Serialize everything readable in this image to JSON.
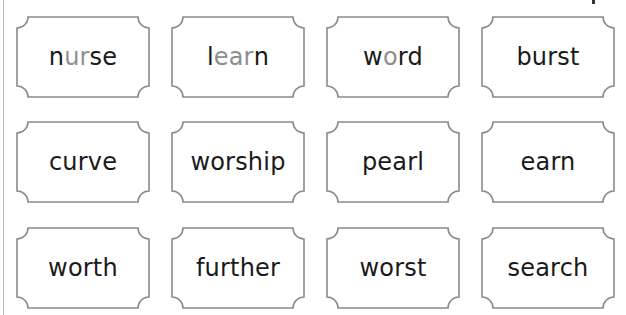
{
  "worksheet": {
    "border_color": "#8a8a8a",
    "text_color": "#1a1a1a",
    "highlight_color": "#8e8e8e",
    "cards": [
      {
        "word": "nurse",
        "parts": [
          {
            "t": "n",
            "hl": false
          },
          {
            "t": "ur",
            "hl": true
          },
          {
            "t": "se",
            "hl": false
          }
        ]
      },
      {
        "word": "learn",
        "parts": [
          {
            "t": "l",
            "hl": false
          },
          {
            "t": "ear",
            "hl": true
          },
          {
            "t": "n",
            "hl": false
          }
        ]
      },
      {
        "word": "word",
        "parts": [
          {
            "t": "w",
            "hl": false
          },
          {
            "t": "o",
            "hl": true
          },
          {
            "t": "rd",
            "hl": false
          }
        ]
      },
      {
        "word": "burst",
        "parts": [
          {
            "t": "burst",
            "hl": false
          }
        ]
      },
      {
        "word": "curve",
        "parts": [
          {
            "t": "curve",
            "hl": false
          }
        ]
      },
      {
        "word": "worship",
        "parts": [
          {
            "t": "worship",
            "hl": false
          }
        ]
      },
      {
        "word": "pearl",
        "parts": [
          {
            "t": "pearl",
            "hl": false
          }
        ]
      },
      {
        "word": "earn",
        "parts": [
          {
            "t": "earn",
            "hl": false
          }
        ]
      },
      {
        "word": "worth",
        "parts": [
          {
            "t": "worth",
            "hl": false
          }
        ]
      },
      {
        "word": "further",
        "parts": [
          {
            "t": "further",
            "hl": false
          }
        ]
      },
      {
        "word": "worst",
        "parts": [
          {
            "t": "worst",
            "hl": false
          }
        ]
      },
      {
        "word": "search",
        "parts": [
          {
            "t": "search",
            "hl": false
          }
        ]
      }
    ]
  }
}
